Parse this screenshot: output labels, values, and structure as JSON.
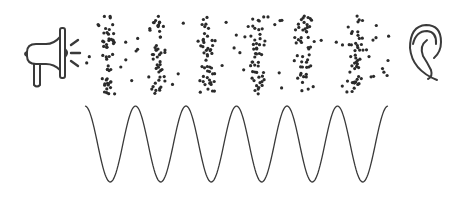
{
  "diagram": {
    "title": "Sound wave propagation from megaphone to ear",
    "colors": {
      "background": "#ffffff",
      "stroke": "#3a3a3a",
      "dot": "#2b2b2b"
    },
    "source": {
      "label": "megaphone",
      "icon": "megaphone-icon"
    },
    "receiver": {
      "label": "ear",
      "icon": "ear-icon"
    },
    "particles": {
      "description": "air particles in compression and rarefaction bands",
      "band_centers_x": [
        108,
        157,
        208,
        257,
        305,
        356
      ],
      "y_range": [
        16,
        94
      ],
      "dots_per_band": 46,
      "sparse_dots": 60,
      "dot_radius": 1.6
    },
    "wave": {
      "description": "sinusoidal pressure wave",
      "x_start": 85,
      "x_end": 388,
      "y_peak": 106,
      "y_trough": 182,
      "peaks_x": [
        110,
        160,
        210,
        260,
        311,
        362
      ],
      "cycles": 6
    }
  }
}
